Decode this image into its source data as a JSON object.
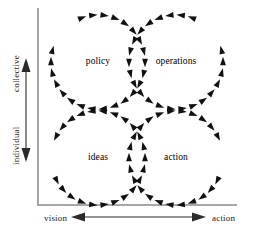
{
  "figure": {
    "background_color": "#ffffff",
    "ink_color": "#111111",
    "axis_color": "#8c8c8c"
  },
  "axes": {
    "vertical": {
      "name": "collective-individual-axis",
      "top_label": "collective",
      "bottom_label": "individual",
      "arrow_style": "double-headed",
      "orientation": "vertical"
    },
    "horizontal": {
      "name": "vision-action-axis",
      "left_label": "vision",
      "right_label": "action",
      "arrow_style": "double-headed",
      "orientation": "horizontal"
    }
  },
  "chart_data": {
    "type": "diagram",
    "title": "",
    "xlabel": "vision ↔ action",
    "ylabel": "individual ↔ collective",
    "quadrants": [
      {
        "id": "policy",
        "label": "policy",
        "x_position": "left",
        "y_position": "top",
        "center": [
          98,
          62
        ],
        "radius": 47,
        "rotation": "clockwise",
        "arrow_count": 26
      },
      {
        "id": "operations",
        "label": "operations",
        "x_position": "right",
        "y_position": "top",
        "center": [
          176,
          62
        ],
        "radius": 47,
        "rotation": "counter-clockwise",
        "arrow_count": 26
      },
      {
        "id": "ideas",
        "label": "ideas",
        "x_position": "left",
        "y_position": "bottom",
        "center": [
          98,
          158
        ],
        "radius": 47,
        "rotation": "counter-clockwise",
        "arrow_count": 26
      },
      {
        "id": "action",
        "label": "action",
        "x_position": "right",
        "y_position": "bottom",
        "center": [
          176,
          158
        ],
        "radius": 47,
        "rotation": "clockwise",
        "arrow_count": 26
      }
    ]
  }
}
